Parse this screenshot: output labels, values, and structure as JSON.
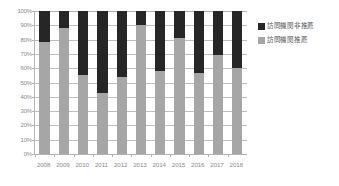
{
  "chart_data": {
    "type": "bar",
    "stacked": true,
    "percent_stacked": true,
    "title": "",
    "subtitle": "",
    "xlabel": "",
    "ylabel": "",
    "ylim": [
      0,
      100
    ],
    "grid": true,
    "legend_position": "right",
    "categories": [
      "2008",
      "2009",
      "2010",
      "2011",
      "2012",
      "2013",
      "2014",
      "2015",
      "2016",
      "2017",
      "2018"
    ],
    "ytick_labels": [
      "100%",
      "90%",
      "80%",
      "70%",
      "60%",
      "50%",
      "40%",
      "30%",
      "20%",
      "10%",
      "0%"
    ],
    "ytick_values": [
      100,
      90,
      80,
      70,
      60,
      50,
      40,
      30,
      20,
      10,
      0
    ],
    "series": [
      {
        "name": "訪問機関推薦",
        "color": "#a6a6a6",
        "values": [
          78,
          88,
          55,
          43,
          54,
          90,
          58,
          81,
          57,
          69,
          60
        ]
      },
      {
        "name": "訪問機関非推薦",
        "color": "#262626",
        "values": [
          22,
          12,
          45,
          57,
          46,
          10,
          42,
          19,
          43,
          31,
          40
        ]
      }
    ]
  },
  "legend": {
    "items": [
      {
        "label": "訪問機関非推薦",
        "color": "#262626"
      },
      {
        "label": "訪問機関推薦",
        "color": "#a6a6a6"
      }
    ]
  },
  "colors": {
    "series_dark": "#262626",
    "series_gray": "#a6a6a6",
    "gridline": "#bfbfbf",
    "axis": "#b3b3b3",
    "tick_text": "#8c8c8c",
    "legend_text": "#595959",
    "background": "#ffffff"
  }
}
